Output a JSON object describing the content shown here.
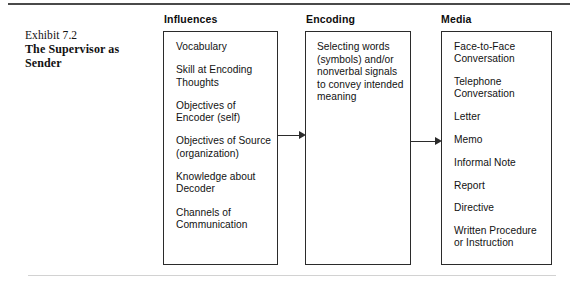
{
  "caption": {
    "eyebrow": "Exhibit 7.2",
    "title": "The Supervisor as Sender"
  },
  "columns": [
    {
      "header": "Influences",
      "type": "list",
      "items": [
        "Vocabulary",
        "Skill at Encoding Thoughts",
        "Objectives of Encoder (self)",
        "Objectives of Source (organization)",
        "Knowledge about Decoder",
        "Channels of Communication"
      ]
    },
    {
      "header": "Encoding",
      "type": "paragraph",
      "text": "Selecting words (symbols) and/or nonverbal signals to convey intended meaning"
    },
    {
      "header": "Media",
      "type": "list",
      "items": [
        "Face-to-Face Conversation",
        "Telephone Conversation",
        "Letter",
        "Memo",
        "Informal Note",
        "Report",
        "Directive",
        "Written Procedure or Instruction"
      ]
    }
  ],
  "connectors": [
    {
      "from": "Influences",
      "to": "Encoding",
      "glyph": "arrow-right"
    },
    {
      "from": "Encoding",
      "to": "Media",
      "glyph": "arrow-right"
    }
  ],
  "colors": {
    "ink": "#121212",
    "rule": "#4a4a4a",
    "box_border": "#2b2b2b",
    "page": "#ffffff"
  }
}
